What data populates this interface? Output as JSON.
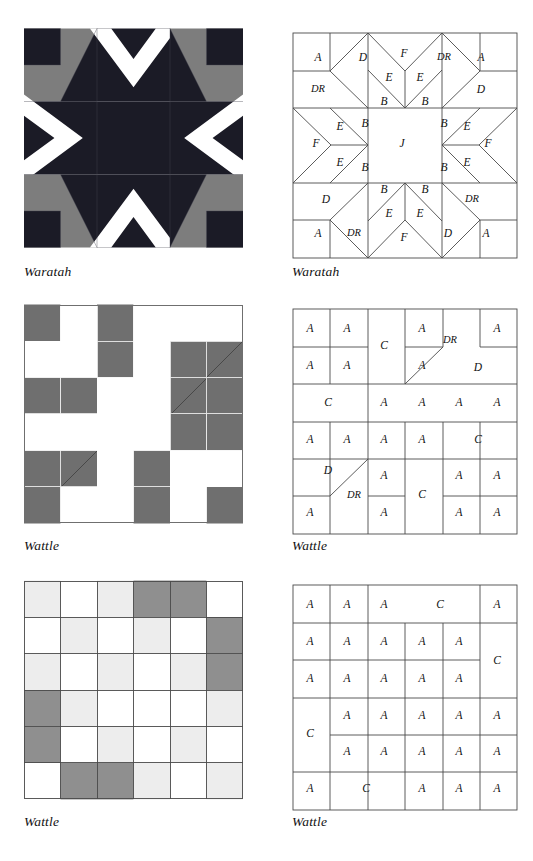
{
  "page": {
    "width": 533,
    "height": 861,
    "background": "#ffffff"
  },
  "palette": {
    "dark": "#1b1b26",
    "mid_gray": "#7d7d7d",
    "wattle_gray": "#6f6f6f",
    "light_gray": "#ededed",
    "white": "#ffffff",
    "line": "#3a3a3a",
    "grid_line": "#555555",
    "text": "#111111"
  },
  "blocks": [
    {
      "id": "waratah",
      "caption": "Waratah",
      "pattern_name": "Waratah",
      "grid": 6,
      "colors_used": [
        "#1b1b26",
        "#7d7d7d",
        "#ffffff"
      ],
      "diagram_caption": "Waratah",
      "piece_labels": [
        "A",
        "D",
        "F",
        "DR",
        "E",
        "B",
        "J"
      ]
    },
    {
      "id": "wattle-1",
      "caption": "Wattle",
      "pattern_name": "Wattle",
      "grid": 6,
      "colors_used": [
        "#6f6f6f",
        "#ffffff",
        "#f4f4f4"
      ],
      "diagram_caption": "Wattle",
      "piece_labels": [
        "A",
        "C",
        "D",
        "DR"
      ]
    },
    {
      "id": "wattle-2",
      "caption": "Wattle",
      "pattern_name": "Wattle",
      "grid": 6,
      "colors_used": [
        "#8f8f8f",
        "#ededed",
        "#ffffff"
      ],
      "diagram_caption": "Wattle",
      "piece_labels": [
        "A",
        "C"
      ]
    }
  ],
  "waratah_diagram": {
    "labels": [
      {
        "text": "A",
        "x": 26,
        "y": 26
      },
      {
        "text": "D",
        "x": 71,
        "y": 26
      },
      {
        "text": "F",
        "x": 112,
        "y": 22
      },
      {
        "text": "DR",
        "x": 152,
        "y": 26
      },
      {
        "text": "A",
        "x": 189,
        "y": 26
      },
      {
        "text": "DR",
        "x": 26,
        "y": 58
      },
      {
        "text": "E",
        "x": 97,
        "y": 46
      },
      {
        "text": "E",
        "x": 128,
        "y": 46
      },
      {
        "text": "B",
        "x": 92,
        "y": 70
      },
      {
        "text": "B",
        "x": 133,
        "y": 70
      },
      {
        "text": "D",
        "x": 189,
        "y": 58
      },
      {
        "text": "E",
        "x": 48,
        "y": 95
      },
      {
        "text": "B",
        "x": 73,
        "y": 92
      },
      {
        "text": "B",
        "x": 152,
        "y": 92
      },
      {
        "text": "E",
        "x": 175,
        "y": 95
      },
      {
        "text": "F",
        "x": 24,
        "y": 112
      },
      {
        "text": "J",
        "x": 110,
        "y": 112
      },
      {
        "text": "F",
        "x": 196,
        "y": 112
      },
      {
        "text": "E",
        "x": 48,
        "y": 131
      },
      {
        "text": "B",
        "x": 73,
        "y": 136
      },
      {
        "text": "B",
        "x": 152,
        "y": 136
      },
      {
        "text": "E",
        "x": 175,
        "y": 131
      },
      {
        "text": "D",
        "x": 34,
        "y": 168
      },
      {
        "text": "B",
        "x": 92,
        "y": 158
      },
      {
        "text": "B",
        "x": 133,
        "y": 158
      },
      {
        "text": "E",
        "x": 97,
        "y": 182
      },
      {
        "text": "E",
        "x": 128,
        "y": 182
      },
      {
        "text": "DR",
        "x": 180,
        "y": 168
      },
      {
        "text": "A",
        "x": 26,
        "y": 202
      },
      {
        "text": "DR",
        "x": 62,
        "y": 202
      },
      {
        "text": "F",
        "x": 112,
        "y": 206
      },
      {
        "text": "D",
        "x": 156,
        "y": 202
      },
      {
        "text": "A",
        "x": 194,
        "y": 202
      }
    ]
  },
  "wattle1_diagram": {
    "labels": [
      {
        "text": "A",
        "x": 18,
        "y": 21
      },
      {
        "text": "A",
        "x": 55,
        "y": 21
      },
      {
        "text": "C",
        "x": 92,
        "y": 38
      },
      {
        "text": "A",
        "x": 130,
        "y": 21
      },
      {
        "text": "DR",
        "x": 158,
        "y": 33
      },
      {
        "text": "A",
        "x": 205,
        "y": 21
      },
      {
        "text": "A",
        "x": 18,
        "y": 58
      },
      {
        "text": "A",
        "x": 55,
        "y": 58
      },
      {
        "text": "A",
        "x": 130,
        "y": 58
      },
      {
        "text": "D",
        "x": 186,
        "y": 60
      },
      {
        "text": "C",
        "x": 36,
        "y": 95
      },
      {
        "text": "A",
        "x": 92,
        "y": 95
      },
      {
        "text": "A",
        "x": 130,
        "y": 95
      },
      {
        "text": "A",
        "x": 167,
        "y": 95
      },
      {
        "text": "A",
        "x": 205,
        "y": 95
      },
      {
        "text": "A",
        "x": 18,
        "y": 132
      },
      {
        "text": "A",
        "x": 55,
        "y": 132
      },
      {
        "text": "A",
        "x": 92,
        "y": 132
      },
      {
        "text": "A",
        "x": 130,
        "y": 132
      },
      {
        "text": "C",
        "x": 186,
        "y": 132
      },
      {
        "text": "D",
        "x": 36,
        "y": 163
      },
      {
        "text": "DR",
        "x": 62,
        "y": 188
      },
      {
        "text": "A",
        "x": 92,
        "y": 168
      },
      {
        "text": "C",
        "x": 130,
        "y": 187
      },
      {
        "text": "A",
        "x": 167,
        "y": 168
      },
      {
        "text": "A",
        "x": 205,
        "y": 168
      },
      {
        "text": "A",
        "x": 18,
        "y": 205
      },
      {
        "text": "A",
        "x": 92,
        "y": 205
      },
      {
        "text": "A",
        "x": 167,
        "y": 205
      },
      {
        "text": "A",
        "x": 205,
        "y": 205
      }
    ]
  },
  "wattle2_diagram": {
    "labels": [
      {
        "text": "A",
        "x": 18,
        "y": 21
      },
      {
        "text": "A",
        "x": 55,
        "y": 21
      },
      {
        "text": "A",
        "x": 92,
        "y": 21
      },
      {
        "text": "C",
        "x": 148,
        "y": 21
      },
      {
        "text": "A",
        "x": 205,
        "y": 21
      },
      {
        "text": "A",
        "x": 18,
        "y": 58
      },
      {
        "text": "A",
        "x": 55,
        "y": 58
      },
      {
        "text": "A",
        "x": 92,
        "y": 58
      },
      {
        "text": "A",
        "x": 130,
        "y": 58
      },
      {
        "text": "A",
        "x": 167,
        "y": 58
      },
      {
        "text": "C",
        "x": 205,
        "y": 77
      },
      {
        "text": "A",
        "x": 18,
        "y": 95
      },
      {
        "text": "A",
        "x": 55,
        "y": 95
      },
      {
        "text": "A",
        "x": 92,
        "y": 95
      },
      {
        "text": "A",
        "x": 130,
        "y": 95
      },
      {
        "text": "A",
        "x": 167,
        "y": 95
      },
      {
        "text": "C",
        "x": 18,
        "y": 150
      },
      {
        "text": "A",
        "x": 55,
        "y": 132
      },
      {
        "text": "A",
        "x": 92,
        "y": 132
      },
      {
        "text": "A",
        "x": 130,
        "y": 132
      },
      {
        "text": "A",
        "x": 167,
        "y": 132
      },
      {
        "text": "A",
        "x": 205,
        "y": 132
      },
      {
        "text": "A",
        "x": 55,
        "y": 168
      },
      {
        "text": "A",
        "x": 92,
        "y": 168
      },
      {
        "text": "A",
        "x": 130,
        "y": 168
      },
      {
        "text": "A",
        "x": 167,
        "y": 168
      },
      {
        "text": "A",
        "x": 205,
        "y": 168
      },
      {
        "text": "A",
        "x": 18,
        "y": 205
      },
      {
        "text": "C",
        "x": 74,
        "y": 205
      },
      {
        "text": "A",
        "x": 130,
        "y": 205
      },
      {
        "text": "A",
        "x": 167,
        "y": 205
      },
      {
        "text": "A",
        "x": 205,
        "y": 205
      }
    ]
  },
  "wattle1_block": {
    "fills": [
      [
        1,
        0,
        1,
        0,
        1,
        0
      ],
      [
        0,
        0,
        1,
        0,
        1,
        1
      ],
      [
        1,
        1,
        0,
        0,
        0,
        0
      ],
      [
        0,
        0,
        0,
        0,
        1,
        1
      ],
      [
        1,
        1,
        0,
        1,
        0,
        0
      ],
      [
        0,
        1,
        0,
        1,
        0,
        1
      ]
    ]
  },
  "wattle2_block": {
    "fills": [
      [
        2,
        0,
        2,
        1,
        1,
        0
      ],
      [
        0,
        2,
        0,
        2,
        0,
        1
      ],
      [
        2,
        0,
        2,
        0,
        2,
        1
      ],
      [
        1,
        2,
        0,
        0,
        0,
        2
      ],
      [
        1,
        0,
        2,
        0,
        2,
        0
      ],
      [
        0,
        1,
        1,
        2,
        0,
        2
      ]
    ]
  }
}
